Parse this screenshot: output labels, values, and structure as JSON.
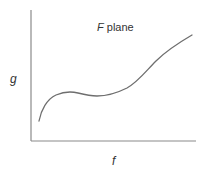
{
  "diagram": {
    "title_symbol": "F",
    "title_text": " plane",
    "x_axis_label": "f",
    "y_axis_label": "g",
    "colors": {
      "axis": "#8a8a8a",
      "curve": "#6e6e6e",
      "text": "#333333"
    },
    "axes": {
      "origin": [
        31,
        141
      ],
      "y_top": [
        31,
        10
      ],
      "x_end": [
        196,
        141
      ]
    },
    "curve_points": [
      [
        39,
        121
      ],
      [
        44,
        106
      ],
      [
        52,
        97
      ],
      [
        60,
        93
      ],
      [
        68,
        92
      ],
      [
        80,
        94
      ],
      [
        93,
        96
      ],
      [
        108,
        94
      ],
      [
        125,
        89
      ],
      [
        138,
        80
      ],
      [
        150,
        68
      ],
      [
        163,
        56
      ],
      [
        178,
        45
      ],
      [
        192,
        35
      ]
    ]
  }
}
